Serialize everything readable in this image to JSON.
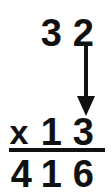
{
  "problem": {
    "type": "long-multiplication",
    "multiplicand": "32",
    "multiplier": "13",
    "partial_product": "416",
    "operator": "x",
    "arrow": {
      "from": "ones-digit-of-multiplicand",
      "to": "ones-digit-of-multiplier",
      "direction": "down"
    }
  },
  "rows": {
    "multiplicand": {
      "hundreds": "",
      "tens": "3",
      "ones": "2"
    },
    "multiplier": {
      "operator": "x",
      "hundreds": "",
      "tens": "1",
      "ones": "3"
    },
    "product": {
      "hundreds": "4",
      "tens": "1",
      "ones": "6"
    }
  },
  "colors": {
    "ink": "#111111",
    "paper": "#ffffff"
  }
}
